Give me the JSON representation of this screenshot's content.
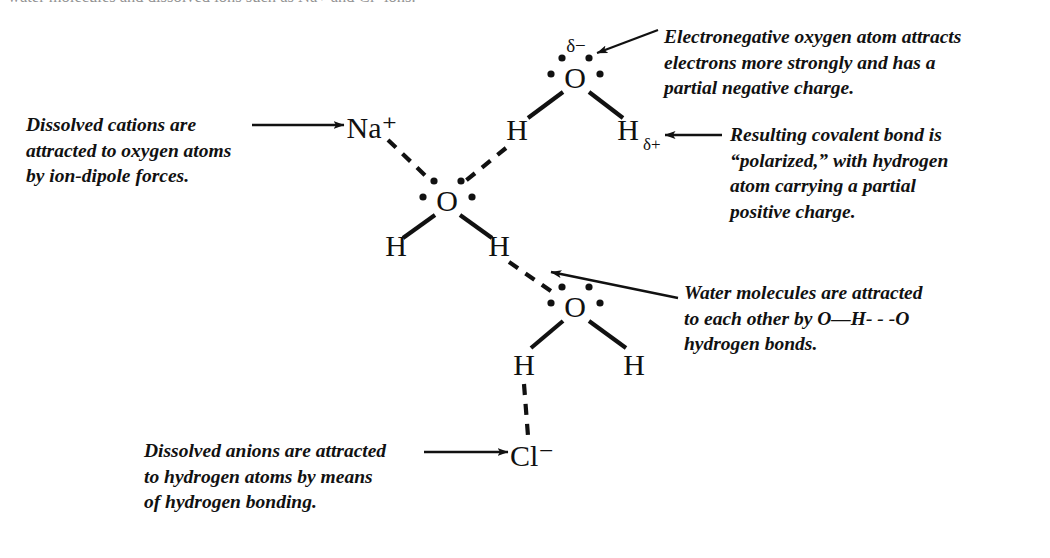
{
  "figure": {
    "kind": "chemistry-diagram",
    "clipped_header_text": "water molecules and dissolved ions such as Na+ and Cl- ions.",
    "background_color": "#ffffff",
    "ink_color": "#111111"
  },
  "annotations": {
    "cations": "Dissolved cations are\nattracted to oxygen atoms\nby ion-dipole forces.",
    "electronegative": "Electronegative oxygen atom attracts\nelectrons more strongly and has a\npartial negative charge.",
    "polarized": "Resulting covalent bond is\n“polarized,” with hydrogen\natom carrying a partial\npositive charge.",
    "water_molecules": "Water molecules are attracted\nto each other by O—H- - -O\nhydrogen bonds.",
    "anions": "Dissolved anions are attracted\nto hydrogen atoms by means\nof hydrogen bonding."
  },
  "atoms": {
    "sodium_ion": "Na⁺",
    "chloride_ion": "Cl⁻",
    "oxygen": "O",
    "hydrogen": "H",
    "delta_minus": "δ−",
    "hydrogen_delta_plus_symbol": "H",
    "hydrogen_delta_plus_subscript": "δ+"
  },
  "molecules": [
    {
      "id": "water-top",
      "label": "top water molecule",
      "oxygen": {
        "label": "O",
        "x": 575,
        "y": 78
      },
      "charge_label": {
        "text": "δ−",
        "x": 576,
        "y": 46
      },
      "hydrogens": [
        {
          "label": "H",
          "x": 517,
          "y": 130,
          "bond": "covalent"
        },
        {
          "label": "H",
          "x": 630,
          "y": 130,
          "bond": "covalent",
          "subscript": "δ+"
        }
      ],
      "lone_pair_dots": 4
    },
    {
      "id": "water-center",
      "label": "central water molecule",
      "oxygen": {
        "label": "O",
        "x": 447,
        "y": 201
      },
      "hydrogens": [
        {
          "label": "H",
          "x": 396,
          "y": 245,
          "bond": "covalent"
        },
        {
          "label": "H",
          "x": 499,
          "y": 245,
          "bond": "covalent"
        }
      ],
      "lone_pair_dots": 4
    },
    {
      "id": "water-bottom",
      "label": "bottom water molecule",
      "oxygen": {
        "label": "O",
        "x": 575,
        "y": 307
      },
      "hydrogens": [
        {
          "label": "H",
          "x": 524,
          "y": 364,
          "bond": "covalent"
        },
        {
          "label": "H",
          "x": 634,
          "y": 364,
          "bond": "covalent"
        }
      ],
      "lone_pair_dots": 4
    }
  ],
  "ions": [
    {
      "id": "sodium",
      "label": "Na⁺",
      "x": 372,
      "y": 128,
      "interaction": "ion-dipole with central oxygen"
    },
    {
      "id": "chloride",
      "label": "Cl⁻",
      "x": 532,
      "y": 456,
      "interaction": "hydrogen bond with bottom-left hydrogen"
    }
  ],
  "bonds": [
    {
      "type": "ion-dipole",
      "style": "dashed",
      "from": "Na+",
      "to": "central O"
    },
    {
      "type": "hydrogen-bond",
      "style": "dashed",
      "from": "top water H",
      "to": "central O"
    },
    {
      "type": "hydrogen-bond",
      "style": "dashed",
      "from": "central water H",
      "to": "bottom O"
    },
    {
      "type": "hydrogen-bond",
      "style": "dashed",
      "from": "bottom water H",
      "to": "Cl-"
    },
    {
      "type": "covalent",
      "style": "solid",
      "from": "O",
      "to": "H"
    }
  ],
  "leader_lines": [
    {
      "id": "cations-arrow",
      "head": "arrow",
      "points_to": "Na⁺"
    },
    {
      "id": "electronegative-arrow",
      "head": "arrow",
      "points_to": "δ− on top oxygen"
    },
    {
      "id": "polarized-arrow",
      "head": "arrow",
      "points_to": "Hδ+"
    },
    {
      "id": "watermol-arrow",
      "head": "arrow",
      "points_to": "hydrogen bond to bottom oxygen"
    },
    {
      "id": "anions-arrow",
      "head": "arrow",
      "points_to": "Cl⁻"
    }
  ]
}
